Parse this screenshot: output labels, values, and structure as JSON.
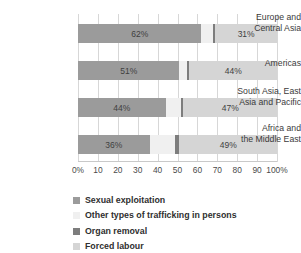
{
  "chart_data": {
    "type": "bar",
    "orientation": "horizontal",
    "stacked": true,
    "title": "",
    "xlabel": "",
    "ylabel": "",
    "xlim": [
      0,
      100
    ],
    "grid": true,
    "legend_position": "bottom",
    "categories": [
      "Europe and\nCentral Asia",
      "Americas",
      "South Asia, East\nAsia and Pacific",
      "Africa and\nthe Middle East"
    ],
    "category_lines": [
      [
        "Europe and",
        "Central Asia"
      ],
      [
        "Americas"
      ],
      [
        "South Asia, East",
        "Asia and Pacific"
      ],
      [
        "Africa and",
        "the Middle East"
      ]
    ],
    "series": [
      {
        "name": "Sexual exploitation",
        "color": "#9b9b9b",
        "values": [
          62,
          51,
          44,
          36
        ],
        "labels": [
          "62%",
          "51%",
          "44%",
          "36%"
        ]
      },
      {
        "name": "Other types of trafficking in persons",
        "color": "#f0f0f0",
        "values": [
          6,
          4,
          8,
          13
        ],
        "labels": [
          "",
          "",
          "",
          ""
        ]
      },
      {
        "name": "Organ removal",
        "color": "#7d7d7d",
        "values": [
          1,
          1,
          1,
          2
        ],
        "labels": [
          "",
          "",
          "",
          ""
        ]
      },
      {
        "name": "Forced labour",
        "color": "#d5d5d5",
        "values": [
          31,
          44,
          47,
          49
        ],
        "labels": [
          "31%",
          "44%",
          "47%",
          "49%"
        ]
      }
    ],
    "xticks": [
      {
        "value": 0,
        "label": "0%"
      },
      {
        "value": 10,
        "label": "10"
      },
      {
        "value": 20,
        "label": "20"
      },
      {
        "value": 30,
        "label": "30"
      },
      {
        "value": 40,
        "label": "40"
      },
      {
        "value": 50,
        "label": "50"
      },
      {
        "value": 60,
        "label": "60"
      },
      {
        "value": 70,
        "label": "70"
      },
      {
        "value": 80,
        "label": "80"
      },
      {
        "value": 90,
        "label": "90"
      },
      {
        "value": 100,
        "label": "100%"
      }
    ],
    "legend": [
      {
        "label": "Sexual exploitation",
        "color": "#9b9b9b"
      },
      {
        "label": "Other types of trafficking in persons",
        "color": "#f0f0f0"
      },
      {
        "label": "Organ removal",
        "color": "#7d7d7d"
      },
      {
        "label": "Forced labour",
        "color": "#d5d5d5"
      }
    ]
  }
}
